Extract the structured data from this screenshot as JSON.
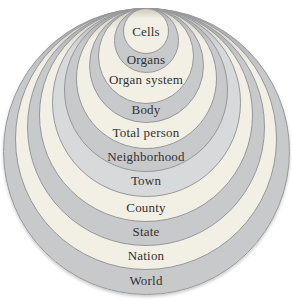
{
  "diagram": {
    "background_color": "#ffffff",
    "outline_color": "#96979a",
    "text_color": "#323232",
    "palette": {
      "cream": {
        "base": "#f2efe5",
        "top_shade": "#ccc9bf"
      },
      "gray": {
        "base": "#c8c9cb",
        "top_shade": "#a2a3a5"
      },
      "light_gray": {
        "base": "#d8d9db",
        "top_shade": "#b4b5b7"
      }
    },
    "geometry": {
      "center_x": 146,
      "top_tangent_y": 8
    },
    "rings": [
      {
        "label": "World",
        "tone": "gray",
        "diameter": 287,
        "label_y": 281
      },
      {
        "label": "Nation",
        "tone": "cream",
        "diameter": 262,
        "label_y": 256
      },
      {
        "label": "State",
        "tone": "gray",
        "diameter": 238,
        "label_y": 232
      },
      {
        "label": "County",
        "tone": "cream",
        "diameter": 214,
        "label_y": 208
      },
      {
        "label": "Town",
        "tone": "light_gray",
        "diameter": 189,
        "label_y": 181
      },
      {
        "label": "Neighborhood",
        "tone": "gray",
        "diameter": 164,
        "label_y": 157
      },
      {
        "label": "Total person",
        "tone": "cream",
        "diameter": 141,
        "label_y": 133
      },
      {
        "label": "Body",
        "tone": "gray",
        "diameter": 115,
        "label_y": 110
      },
      {
        "label": "Organ system",
        "tone": "cream",
        "diameter": 96,
        "label_y": 80
      },
      {
        "label": "Organs",
        "tone": "gray",
        "diameter": 65,
        "label_y": 60
      },
      {
        "label": "Cells",
        "tone": "cream",
        "diameter": 46,
        "label_y": 32
      }
    ]
  }
}
